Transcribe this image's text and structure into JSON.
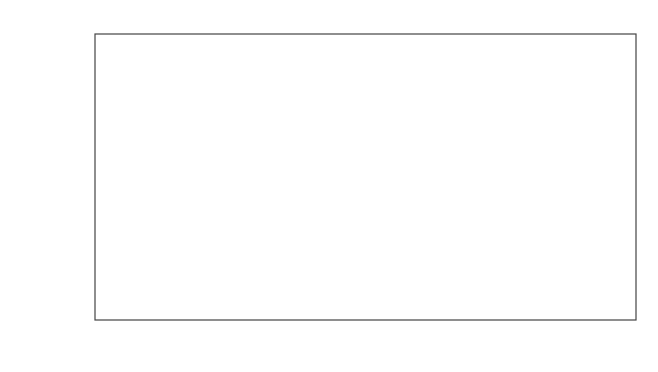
{
  "chart_data": {
    "type": "bar",
    "title": "",
    "xlabel": "",
    "ylabel": "Amplitude (V)",
    "ylim": [
      2.0,
      5.0
    ],
    "yticks": [
      "2.0",
      "2.5",
      "3.0",
      "3.5",
      "4.0",
      "4.5",
      "5.0"
    ],
    "grid": "horizontal dotted",
    "categories": [
      "Testpoint 4"
    ],
    "series": [
      {
        "name": "Detector 1",
        "values": [
          3.38
        ],
        "pattern": "horizontal"
      },
      {
        "name": "Detector 2",
        "values": [
          3.52
        ],
        "pattern": "dashed-vertical"
      },
      {
        "name": "Detector 3",
        "values": [
          4.53
        ],
        "pattern": "diagonal"
      },
      {
        "name": "Detector 4",
        "values": [
          3.97
        ],
        "pattern": "vertical"
      }
    ],
    "legend": "labels above bars"
  }
}
